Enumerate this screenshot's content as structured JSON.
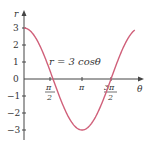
{
  "chart_data": {
    "type": "line",
    "title": "",
    "annotation": "r = 3 cosθ",
    "xlabel": "θ",
    "ylabel": "r",
    "x_ticks": [
      {
        "value": 1.5708,
        "num": "π",
        "den": "2"
      },
      {
        "value": 3.1416,
        "num": "π",
        "den": ""
      },
      {
        "value": 4.7124,
        "num": "3π",
        "den": "2"
      }
    ],
    "y_ticks": [
      3,
      2,
      1,
      0,
      -1,
      -2,
      -3
    ],
    "y_tick_labels": [
      "3",
      "2",
      "1",
      "0",
      "−1",
      "−2",
      "−3"
    ],
    "xlim": [
      0,
      6.0
    ],
    "ylim": [
      -3.5,
      3.5
    ],
    "series": [
      {
        "name": "r = 3 cosθ",
        "color": "#d0607a",
        "x": [
          0,
          0.785,
          1.571,
          2.356,
          3.142,
          3.927,
          4.712,
          5.498,
          5.9
        ],
        "values": [
          3,
          2.12,
          0,
          -2.12,
          -3,
          -2.12,
          0,
          2.12,
          2.78
        ]
      }
    ],
    "grid": false,
    "legend": "none"
  },
  "labels": {
    "r_axis": "r",
    "theta_axis": "θ",
    "equation": "r = 3 cosθ",
    "y0": "0",
    "y1": "1",
    "y2": "2",
    "y3": "3",
    "ym1": "−1",
    "ym2": "−2",
    "ym3": "−3",
    "pi": "π",
    "two": "2",
    "three_pi": "3π"
  },
  "colors": {
    "curve": "#d0607a",
    "axis": "#444444"
  }
}
